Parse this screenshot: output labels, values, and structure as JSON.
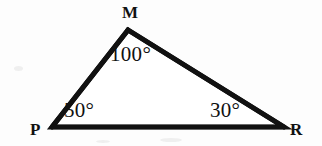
{
  "figure": {
    "kind": "triangle-diagram",
    "background_color": "#fdfdfd",
    "stroke_color": "#111111",
    "stroke_width": 5,
    "text_color": "#111111",
    "vertices": [
      {
        "id": "M",
        "label": "M",
        "x": 128,
        "y": 30
      },
      {
        "id": "P",
        "label": "P",
        "x": 52,
        "y": 127
      },
      {
        "id": "R",
        "label": "R",
        "x": 284,
        "y": 127
      }
    ],
    "vertex_labels": {
      "M": "M",
      "P": "P",
      "R": "R"
    },
    "angles": [
      {
        "at": "M",
        "value": 100,
        "text": "100°"
      },
      {
        "at": "P",
        "value": 50,
        "text": "50°"
      },
      {
        "at": "R",
        "value": 30,
        "text": "30°"
      }
    ],
    "angle_labels": {
      "M": "100°",
      "P": "50°",
      "R": "30°"
    },
    "edges": [
      {
        "from": "P",
        "to": "M"
      },
      {
        "from": "M",
        "to": "R"
      },
      {
        "from": "P",
        "to": "R"
      }
    ],
    "angle_sum": "180°"
  }
}
